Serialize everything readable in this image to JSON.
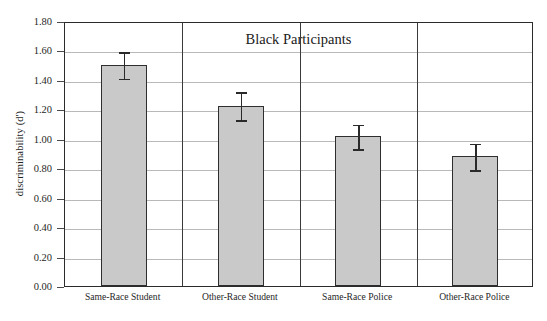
{
  "chart_data": {
    "type": "bar",
    "title": "Black Participants",
    "xlabel": "",
    "ylabel": "discriminability (d')",
    "categories": [
      "Same-Race Student",
      "Other-Race Student",
      "Same-Race Police",
      "Other-Race Police"
    ],
    "values": [
      1.5,
      1.22,
      1.02,
      0.88
    ],
    "errors_upper": [
      1.6,
      1.33,
      1.11,
      0.98
    ],
    "errors_lower": [
      1.41,
      1.13,
      0.93,
      0.79
    ],
    "ylim": [
      0.0,
      1.8
    ],
    "ytick_labels": [
      "0.00",
      "0.20",
      "0.40",
      "0.60",
      "0.80",
      "1.00",
      "1.20",
      "1.40",
      "1.60",
      "1.80"
    ],
    "ytick_values": [
      0.0,
      0.2,
      0.4,
      0.6,
      0.8,
      1.0,
      1.2,
      1.4,
      1.6,
      1.8
    ],
    "grid": true,
    "legend": null,
    "bar_color": "#c9c9c9",
    "bar_edge_color": "#2e2e2e",
    "error_color": "#2a2a2a",
    "grid_color": "#b9b9b9",
    "frame_color": "#2b2b2b",
    "background": "#ffffff"
  }
}
